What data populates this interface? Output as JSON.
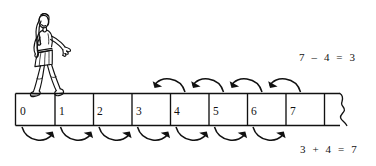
{
  "figure": {
    "illustration": "girl-walking-figure",
    "numberline": {
      "cells": [
        {
          "label": "0"
        },
        {
          "label": "1"
        },
        {
          "label": "2"
        },
        {
          "label": "3"
        },
        {
          "label": "4"
        },
        {
          "label": "5"
        },
        {
          "label": "6"
        },
        {
          "label": "7"
        }
      ],
      "continues_right": true,
      "torn_edge": "wavy-break-line"
    },
    "equations": {
      "subtraction": "7 – 4 = 3",
      "addition": "3 + 4 = 7"
    },
    "arcs": {
      "top": {
        "direction": "left",
        "count": 4,
        "from": "7",
        "to": "3",
        "meaning": "7 – 4 = 3"
      },
      "bottom": {
        "direction": "right",
        "count": 7,
        "from": "0",
        "to": "7",
        "meaning": "3 + 4 = 7"
      }
    },
    "colors": {
      "ink": "#111111",
      "paper": "#ffffff"
    }
  }
}
